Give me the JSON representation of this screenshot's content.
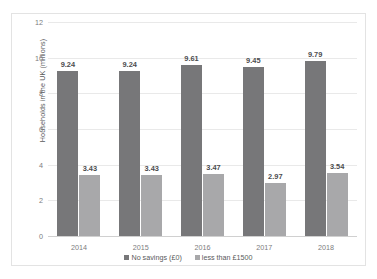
{
  "chart_data": {
    "type": "bar",
    "title": "",
    "xlabel": "",
    "ylabel": "Households in the UK (millions)",
    "categories": [
      "2014",
      "2015",
      "2016",
      "2017",
      "2018"
    ],
    "series": [
      {
        "name": "No savings (£0)",
        "color": "#777779",
        "values": [
          9.24,
          9.24,
          9.61,
          9.45,
          9.79
        ],
        "labels": [
          "9.24",
          "9.24",
          "9.61",
          "9.45",
          "9.79"
        ]
      },
      {
        "name": "less than £1500",
        "color": "#a8a8aa",
        "values": [
          3.43,
          3.43,
          3.47,
          2.97,
          3.54
        ],
        "labels": [
          "3.43",
          "3.43",
          "3.47",
          "2.97",
          "3.54"
        ]
      }
    ],
    "ylim": [
      0,
      12
    ],
    "yticks": [
      0,
      2,
      4,
      6,
      8,
      10,
      12
    ],
    "ytick_labels": [
      "0",
      "2",
      "4",
      "6",
      "8",
      "10",
      "12"
    ],
    "grid": "horizontal",
    "legend_position": "bottom"
  }
}
